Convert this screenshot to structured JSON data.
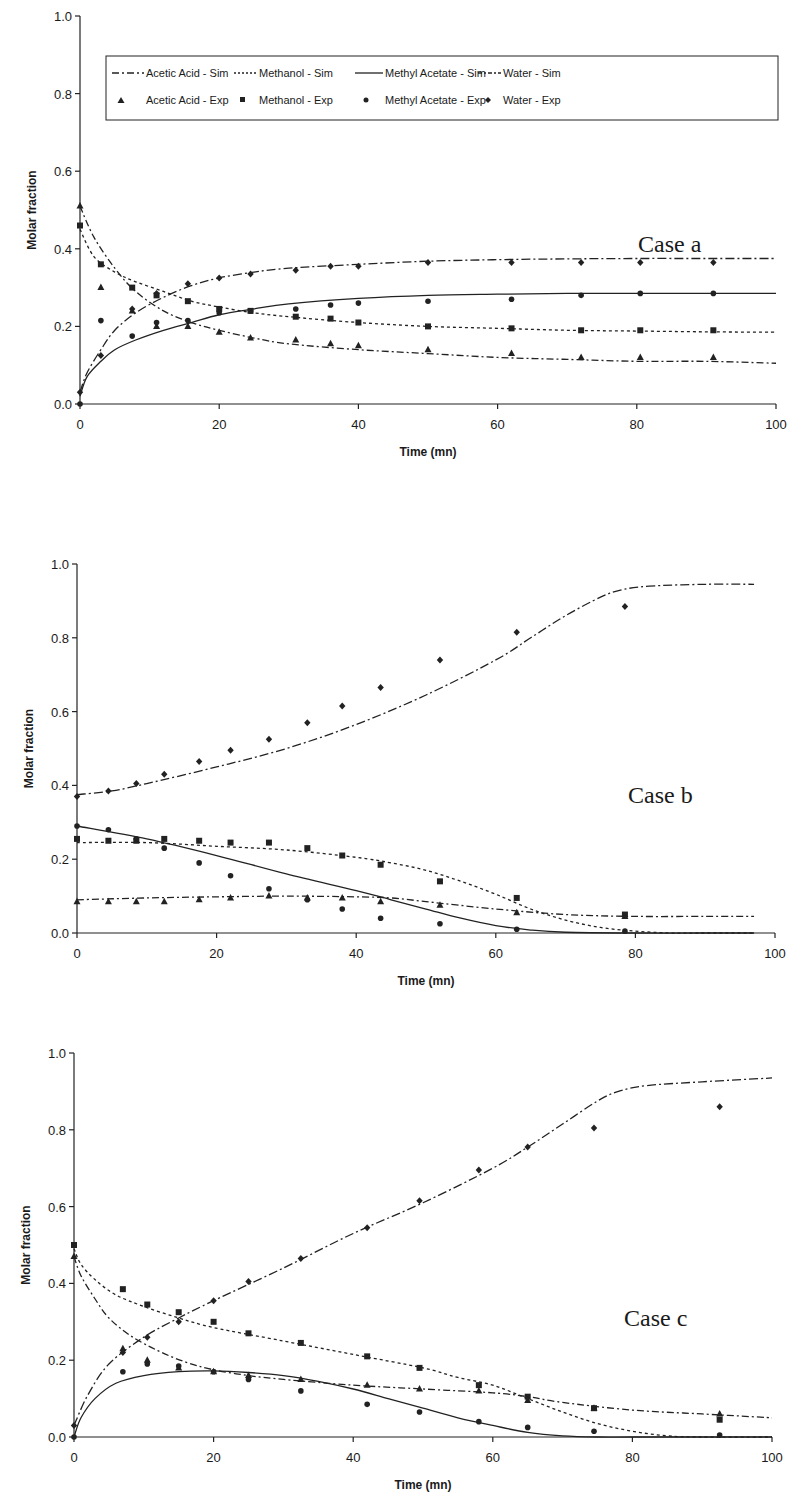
{
  "legend": {
    "items": [
      {
        "label": "Acetic Acid - Sim",
        "kind": "line",
        "series": "acetic_sim"
      },
      {
        "label": "Methanol - Sim",
        "kind": "line",
        "series": "methanol_sim"
      },
      {
        "label": "Methyl Acetate - Sim",
        "kind": "line",
        "series": "methylacetate_sim"
      },
      {
        "label": "Water - Sim",
        "kind": "line",
        "series": "water_sim"
      },
      {
        "label": "Acetic Acid - Exp",
        "kind": "marker",
        "series": "acetic_exp"
      },
      {
        "label": "Methanol - Exp",
        "kind": "marker",
        "series": "methanol_exp"
      },
      {
        "label": "Methyl Acetate - Exp",
        "kind": "marker",
        "series": "methylacetate_exp"
      },
      {
        "label": "Water - Exp",
        "kind": "marker",
        "series": "water_exp"
      }
    ]
  },
  "styles": {
    "acetic_sim": {
      "dash": "7 3 2 3",
      "marker": "triangle"
    },
    "methanol_sim": {
      "dash": "3 3",
      "marker": "square"
    },
    "methylacetate_sim": {
      "dash": "",
      "marker": "circle"
    },
    "water_sim": {
      "dash": "9 3 2 3",
      "marker": "diamond"
    },
    "line_color": "#222222"
  },
  "chart_data": [
    {
      "type": "line",
      "title": "Case a",
      "xlabel": "Time (mn)",
      "ylabel": "Molar fraction",
      "xlim": [
        0,
        100
      ],
      "ylim": [
        0,
        1.0
      ],
      "xticks": [
        0,
        20,
        40,
        60,
        80,
        100
      ],
      "yticks": [
        "0.0",
        "0.2",
        "0.4",
        "0.6",
        "0.8",
        "1.0"
      ],
      "legend_position": "top",
      "grid": false,
      "frame": {
        "x0": 80,
        "x1": 776,
        "y0": 404,
        "y1": 16
      },
      "label_pos": {
        "x": 638,
        "y": 252
      },
      "series": [
        {
          "name": "Acetic Acid - Sim",
          "style": "acetic_sim",
          "x": [
            0,
            2,
            5,
            8,
            12,
            16,
            20,
            25,
            30,
            40,
            50,
            60,
            70,
            80,
            90,
            100
          ],
          "y": [
            0.51,
            0.43,
            0.35,
            0.29,
            0.24,
            0.21,
            0.19,
            0.17,
            0.155,
            0.14,
            0.13,
            0.12,
            0.115,
            0.11,
            0.11,
            0.105
          ]
        },
        {
          "name": "Methanol - Sim",
          "style": "methanol_sim",
          "x": [
            0,
            2,
            5,
            8,
            12,
            16,
            20,
            25,
            30,
            40,
            50,
            60,
            70,
            80,
            90,
            100
          ],
          "y": [
            0.45,
            0.38,
            0.34,
            0.315,
            0.29,
            0.265,
            0.25,
            0.235,
            0.225,
            0.21,
            0.2,
            0.195,
            0.19,
            0.188,
            0.186,
            0.185
          ]
        },
        {
          "name": "Methyl Acetate - Sim",
          "style": "methylacetate_sim",
          "x": [
            0,
            1,
            3,
            5,
            8,
            12,
            16,
            20,
            25,
            30,
            40,
            50,
            60,
            70,
            80,
            90,
            100
          ],
          "y": [
            0.02,
            0.07,
            0.11,
            0.14,
            0.165,
            0.19,
            0.21,
            0.23,
            0.245,
            0.258,
            0.272,
            0.28,
            0.283,
            0.285,
            0.285,
            0.285,
            0.285
          ]
        },
        {
          "name": "Water - Sim",
          "style": "water_sim",
          "x": [
            0,
            1,
            3,
            5,
            8,
            12,
            16,
            20,
            25,
            30,
            40,
            50,
            60,
            70,
            80,
            90,
            100
          ],
          "y": [
            0.03,
            0.08,
            0.14,
            0.19,
            0.235,
            0.275,
            0.305,
            0.325,
            0.34,
            0.35,
            0.36,
            0.368,
            0.372,
            0.374,
            0.375,
            0.375,
            0.375
          ]
        },
        {
          "name": "Acetic Acid - Exp",
          "style": "acetic_sim",
          "marker": "triangle",
          "x": [
            0,
            3,
            7.5,
            11,
            15.5,
            20,
            24.5,
            31,
            36,
            40,
            50,
            62,
            72,
            80.5,
            91
          ],
          "y": [
            0.51,
            0.3,
            0.24,
            0.2,
            0.2,
            0.185,
            0.17,
            0.165,
            0.155,
            0.15,
            0.14,
            0.13,
            0.12,
            0.12,
            0.12
          ]
        },
        {
          "name": "Methanol - Exp",
          "style": "methanol_sim",
          "marker": "square",
          "x": [
            0,
            3,
            7.5,
            11,
            15.5,
            20,
            24.5,
            31,
            36,
            40,
            50,
            62,
            72,
            80.5,
            91
          ],
          "y": [
            0.46,
            0.36,
            0.3,
            0.28,
            0.265,
            0.245,
            0.24,
            0.225,
            0.22,
            0.21,
            0.2,
            0.195,
            0.19,
            0.19,
            0.19
          ]
        },
        {
          "name": "Methyl Acetate - Exp",
          "style": "methylacetate_sim",
          "marker": "circle",
          "x": [
            0,
            3,
            7.5,
            11,
            15.5,
            20,
            24.5,
            31,
            36,
            40,
            50,
            62,
            72,
            80.5,
            91
          ],
          "y": [
            0.0,
            0.215,
            0.175,
            0.21,
            0.215,
            0.235,
            0.24,
            0.245,
            0.255,
            0.26,
            0.265,
            0.27,
            0.28,
            0.285,
            0.285
          ]
        },
        {
          "name": "Water - Exp",
          "style": "water_sim",
          "marker": "diamond",
          "x": [
            0,
            3,
            7.5,
            11,
            15.5,
            20,
            24.5,
            31,
            36,
            40,
            50,
            62,
            72,
            80.5,
            91
          ],
          "y": [
            0.03,
            0.125,
            0.245,
            0.285,
            0.31,
            0.325,
            0.335,
            0.345,
            0.355,
            0.355,
            0.365,
            0.365,
            0.365,
            0.365,
            0.365
          ]
        }
      ]
    },
    {
      "type": "line",
      "title": "Case b",
      "xlabel": "Time (mn)",
      "ylabel": "Molar fraction",
      "xlim": [
        0,
        100
      ],
      "ylim": [
        0,
        1.0
      ],
      "xticks": [
        0,
        20,
        40,
        60,
        80,
        100
      ],
      "yticks": [
        "0.0",
        "0.2",
        "0.4",
        "0.6",
        "0.8",
        "1.0"
      ],
      "grid": false,
      "frame": {
        "x0": 77,
        "x1": 775,
        "y0": 933,
        "y1": 564
      },
      "label_pos": {
        "x": 628,
        "y": 803
      },
      "series": [
        {
          "name": "Acetic Acid - Sim",
          "style": "acetic_sim",
          "x": [
            0,
            10,
            20,
            30,
            40,
            45,
            50,
            60,
            70,
            80,
            90,
            97
          ],
          "y": [
            0.09,
            0.095,
            0.098,
            0.1,
            0.098,
            0.095,
            0.085,
            0.065,
            0.05,
            0.045,
            0.045,
            0.045
          ]
        },
        {
          "name": "Methanol - Sim",
          "style": "methanol_sim",
          "x": [
            0,
            10,
            20,
            30,
            40,
            45,
            50,
            55,
            60,
            65,
            70,
            75,
            80,
            85,
            90,
            97
          ],
          "y": [
            0.245,
            0.245,
            0.235,
            0.225,
            0.205,
            0.19,
            0.17,
            0.14,
            0.105,
            0.065,
            0.035,
            0.015,
            0.005,
            0.0,
            0.0,
            0.0
          ]
        },
        {
          "name": "Methyl Acetate - Sim",
          "style": "methylacetate_sim",
          "x": [
            0,
            10,
            20,
            30,
            40,
            45,
            50,
            55,
            60,
            65,
            70,
            80,
            90,
            97
          ],
          "y": [
            0.29,
            0.255,
            0.21,
            0.16,
            0.115,
            0.09,
            0.065,
            0.04,
            0.02,
            0.008,
            0.002,
            0.0,
            0.0,
            0.0
          ]
        },
        {
          "name": "Water - Sim",
          "style": "water_sim",
          "x": [
            0,
            5,
            10,
            20,
            30,
            40,
            50,
            60,
            65,
            70,
            75,
            78,
            82,
            90,
            97
          ],
          "y": [
            0.375,
            0.385,
            0.405,
            0.45,
            0.5,
            0.565,
            0.645,
            0.74,
            0.8,
            0.86,
            0.91,
            0.93,
            0.94,
            0.945,
            0.945
          ]
        },
        {
          "name": "Acetic Acid - Exp",
          "style": "acetic_sim",
          "marker": "triangle",
          "x": [
            0,
            4.5,
            8.5,
            12.5,
            17.5,
            22,
            27.5,
            33,
            38,
            43.5,
            52,
            63,
            78.5
          ],
          "y": [
            0.085,
            0.085,
            0.085,
            0.085,
            0.09,
            0.095,
            0.1,
            0.095,
            0.095,
            0.085,
            0.075,
            0.055,
            0.045
          ]
        },
        {
          "name": "Methanol - Exp",
          "style": "methanol_sim",
          "marker": "square",
          "x": [
            0,
            4.5,
            8.5,
            12.5,
            17.5,
            22,
            27.5,
            33,
            38,
            43.5,
            52,
            63,
            78.5
          ],
          "y": [
            0.255,
            0.25,
            0.25,
            0.255,
            0.25,
            0.245,
            0.245,
            0.23,
            0.21,
            0.185,
            0.14,
            0.095,
            0.05
          ]
        },
        {
          "name": "Methyl Acetate - Exp",
          "style": "methylacetate_sim",
          "marker": "circle",
          "x": [
            0,
            4.5,
            8.5,
            12.5,
            17.5,
            22,
            27.5,
            33,
            38,
            43.5,
            52,
            63,
            78.5
          ],
          "y": [
            0.29,
            0.28,
            0.255,
            0.23,
            0.19,
            0.155,
            0.12,
            0.09,
            0.065,
            0.04,
            0.025,
            0.01,
            0.005
          ]
        },
        {
          "name": "Water - Exp",
          "style": "water_sim",
          "marker": "diamond",
          "x": [
            0,
            4.5,
            8.5,
            12.5,
            17.5,
            22,
            27.5,
            33,
            38,
            43.5,
            52,
            63,
            78.5
          ],
          "y": [
            0.37,
            0.385,
            0.405,
            0.43,
            0.465,
            0.495,
            0.525,
            0.57,
            0.615,
            0.665,
            0.74,
            0.815,
            0.885
          ]
        }
      ]
    },
    {
      "type": "line",
      "title": "Case c",
      "xlabel": "Time (mn)",
      "ylabel": "Molar fraction",
      "xlim": [
        0,
        100
      ],
      "ylim": [
        0,
        1.0
      ],
      "xticks": [
        0,
        20,
        40,
        60,
        80,
        100
      ],
      "yticks": [
        "0.0",
        "0.2",
        "0.4",
        "0.6",
        "0.8",
        "1.0"
      ],
      "grid": false,
      "frame": {
        "x0": 74,
        "x1": 772,
        "y0": 1437,
        "y1": 1053
      },
      "label_pos": {
        "x": 624,
        "y": 1326
      },
      "series": [
        {
          "name": "Acetic Acid - Sim",
          "style": "acetic_sim",
          "x": [
            0,
            1,
            3,
            5,
            8,
            12,
            16,
            20,
            25,
            30,
            40,
            50,
            60,
            65,
            70,
            80,
            90,
            100
          ],
          "y": [
            0.47,
            0.42,
            0.36,
            0.31,
            0.265,
            0.225,
            0.195,
            0.175,
            0.16,
            0.15,
            0.135,
            0.125,
            0.115,
            0.105,
            0.09,
            0.07,
            0.06,
            0.05
          ]
        },
        {
          "name": "Methanol - Sim",
          "style": "methanol_sim",
          "x": [
            0,
            1,
            3,
            6,
            10,
            15,
            20,
            30,
            40,
            50,
            55,
            60,
            65,
            70,
            75,
            80,
            85,
            90,
            100
          ],
          "y": [
            0.49,
            0.45,
            0.41,
            0.37,
            0.34,
            0.31,
            0.285,
            0.25,
            0.215,
            0.18,
            0.155,
            0.135,
            0.1,
            0.065,
            0.035,
            0.015,
            0.003,
            0.0,
            0.0
          ]
        },
        {
          "name": "Methyl Acetate - Sim",
          "style": "methylacetate_sim",
          "x": [
            0,
            1,
            3,
            6,
            10,
            15,
            20,
            25,
            30,
            35,
            40,
            45,
            50,
            55,
            60,
            65,
            70,
            75,
            80,
            90,
            100
          ],
          "y": [
            0.0,
            0.05,
            0.1,
            0.14,
            0.16,
            0.17,
            0.172,
            0.168,
            0.16,
            0.145,
            0.125,
            0.1,
            0.075,
            0.05,
            0.03,
            0.012,
            0.003,
            0.0,
            0.0,
            0.0,
            0.0
          ]
        },
        {
          "name": "Water - Sim",
          "style": "water_sim",
          "x": [
            0,
            2,
            5,
            10,
            15,
            20,
            30,
            40,
            50,
            60,
            65,
            70,
            75,
            78,
            82,
            90,
            100
          ],
          "y": [
            0.03,
            0.11,
            0.19,
            0.26,
            0.31,
            0.355,
            0.44,
            0.53,
            0.61,
            0.7,
            0.755,
            0.815,
            0.875,
            0.9,
            0.915,
            0.925,
            0.935
          ]
        },
        {
          "name": "Acetic Acid - Exp",
          "style": "acetic_sim",
          "marker": "triangle",
          "x": [
            0,
            7,
            10.5,
            15,
            20,
            25,
            32.5,
            42,
            49.5,
            58,
            65,
            74.5,
            92.5
          ],
          "y": [
            0.47,
            0.23,
            0.2,
            0.18,
            0.17,
            0.16,
            0.15,
            0.135,
            0.125,
            0.12,
            0.095,
            0.075,
            0.06
          ]
        },
        {
          "name": "Methanol - Exp",
          "style": "methanol_sim",
          "marker": "square",
          "x": [
            0,
            7,
            10.5,
            15,
            20,
            25,
            32.5,
            42,
            49.5,
            58,
            65,
            74.5,
            92.5
          ],
          "y": [
            0.5,
            0.385,
            0.345,
            0.325,
            0.3,
            0.27,
            0.245,
            0.21,
            0.18,
            0.135,
            0.105,
            0.075,
            0.045
          ]
        },
        {
          "name": "Methyl Acetate - Exp",
          "style": "methylacetate_sim",
          "marker": "circle",
          "x": [
            0,
            7,
            10.5,
            15,
            20,
            25,
            32.5,
            42,
            49.5,
            58,
            65,
            74.5,
            92.5
          ],
          "y": [
            0.0,
            0.17,
            0.19,
            0.185,
            0.17,
            0.15,
            0.12,
            0.085,
            0.065,
            0.04,
            0.025,
            0.015,
            0.005
          ]
        },
        {
          "name": "Water - Exp",
          "style": "water_sim",
          "marker": "diamond",
          "x": [
            0,
            7,
            10.5,
            15,
            20,
            25,
            32.5,
            42,
            49.5,
            58,
            65,
            74.5,
            92.5
          ],
          "y": [
            0.03,
            0.22,
            0.26,
            0.3,
            0.355,
            0.405,
            0.465,
            0.545,
            0.615,
            0.695,
            0.755,
            0.805,
            0.86
          ]
        }
      ]
    }
  ]
}
